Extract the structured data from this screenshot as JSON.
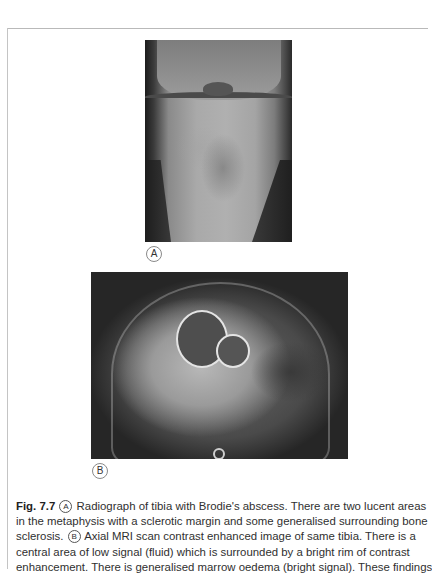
{
  "figure": {
    "number": "Fig. 7.7",
    "panels": [
      {
        "label": "A",
        "description": "Radiograph of tibia (knee joint, proximal tibia) showing lucent areas in metaphysis"
      },
      {
        "label": "B",
        "description": "Axial MRI contrast-enhanced image of tibia with central low-signal cavities and bright rim"
      }
    ],
    "caption_lines": [
      {
        "prefix_bold": "Fig. 7.7",
        "marker": "A",
        "text": "Radiograph of tibia with Brodie's abscess. There are two lucent areas"
      },
      {
        "text": "in the metaphysis with a sclerotic margin and some generalised surrounding bone"
      },
      {
        "text_before": "sclerosis.",
        "marker": "B",
        "text": "Axial MRI scan contrast enhanced image of same tibia. There is a"
      },
      {
        "text": "central area of low signal (fluid) which is surrounded by a bright rim of contrast"
      },
      {
        "text": "enhancement. There is generalised marrow oedema (bright signal). These findings"
      }
    ]
  }
}
